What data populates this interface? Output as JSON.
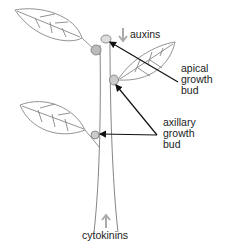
{
  "diagram": {
    "labels": {
      "auxins": "auxins",
      "apical": [
        "apical",
        "growth",
        "bud"
      ],
      "axillary": [
        "axillary",
        "growth",
        "bud"
      ],
      "cytokinins": "cytokinins"
    },
    "colors": {
      "line": "#777777",
      "arrow": "#111111",
      "hormone_arrow": "#aaaaaa",
      "bud": "#bbbbbb"
    }
  }
}
